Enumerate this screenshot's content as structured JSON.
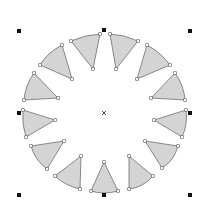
{
  "canvas": {
    "width": 207,
    "height": 213,
    "background": "#ffffff"
  },
  "colors": {
    "wedge_fill": "#d4d4d4",
    "wedge_stroke": "#6e6e6e",
    "handle": "#111111"
  },
  "selection": {
    "handles": [
      [
        19,
        31
      ],
      [
        104,
        30
      ],
      [
        190,
        31
      ],
      [
        19,
        113
      ],
      [
        190,
        113
      ],
      [
        19,
        195
      ],
      [
        104,
        195
      ],
      [
        190,
        195
      ]
    ],
    "center": [
      104,
      113
    ]
  },
  "wedges": [
    {
      "id": 1,
      "a": [
        71,
        41
      ],
      "b": [
        100,
        34
      ],
      "c": [
        93,
        69
      ],
      "arc": [
        86,
        36
      ]
    },
    {
      "id": 2,
      "a": [
        40,
        65
      ],
      "b": [
        62,
        45
      ],
      "c": [
        72,
        79
      ],
      "arc": [
        49,
        54
      ]
    },
    {
      "id": 3,
      "a": [
        24,
        100
      ],
      "b": [
        34,
        73
      ],
      "c": [
        58,
        98
      ],
      "arc": [
        27,
        86
      ]
    },
    {
      "id": 4,
      "a": [
        23,
        110
      ],
      "b": [
        26,
        137
      ],
      "c": [
        55,
        120
      ],
      "arc": [
        23,
        124
      ]
    },
    {
      "id": 5,
      "a": [
        31,
        146
      ],
      "b": [
        47,
        169
      ],
      "c": [
        64,
        141
      ],
      "arc": [
        37,
        159
      ]
    },
    {
      "id": 6,
      "a": [
        55,
        176
      ],
      "b": [
        80,
        189
      ],
      "c": [
        81,
        156
      ],
      "arc": [
        66,
        184
      ]
    },
    {
      "id": 7,
      "a": [
        91,
        191
      ],
      "b": [
        118,
        191
      ],
      "c": [
        104,
        162
      ],
      "arc": [
        104,
        193
      ]
    },
    {
      "id": 8,
      "a": [
        129,
        189
      ],
      "b": [
        153,
        176
      ],
      "c": [
        129,
        156
      ],
      "arc": [
        142,
        185
      ]
    },
    {
      "id": 9,
      "a": [
        162,
        168
      ],
      "b": [
        178,
        146
      ],
      "c": [
        145,
        141
      ],
      "arc": [
        172,
        159
      ]
    },
    {
      "id": 10,
      "a": [
        182,
        137
      ],
      "b": [
        186,
        110
      ],
      "c": [
        154,
        120
      ],
      "arc": [
        186,
        124
      ]
    },
    {
      "id": 11,
      "a": [
        185,
        100
      ],
      "b": [
        175,
        73
      ],
      "c": [
        151,
        98
      ],
      "arc": [
        182,
        86
      ]
    },
    {
      "id": 12,
      "a": [
        170,
        65
      ],
      "b": [
        147,
        45
      ],
      "c": [
        137,
        79
      ],
      "arc": [
        160,
        54
      ]
    },
    {
      "id": 13,
      "a": [
        138,
        41
      ],
      "b": [
        110,
        34
      ],
      "c": [
        116,
        69
      ],
      "arc": [
        124,
        36
      ]
    }
  ]
}
